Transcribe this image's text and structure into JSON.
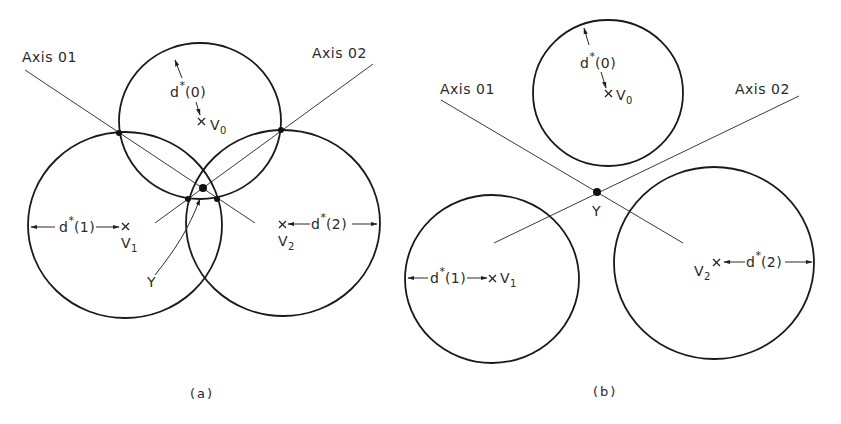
{
  "panels": [
    {
      "id": "a",
      "caption": "(a)",
      "axes": [
        {
          "label": "Axis 01"
        },
        {
          "label": "Axis 02"
        }
      ],
      "circles": [
        {
          "center_label": "V",
          "center_sub": "0",
          "radius_label": "d",
          "radius_sup": "*",
          "radius_arg": "(0)"
        },
        {
          "center_label": "V",
          "center_sub": "1",
          "radius_label": "d",
          "radius_sup": "*",
          "radius_arg": "(1)"
        },
        {
          "center_label": "V",
          "center_sub": "2",
          "radius_label": "d",
          "radius_sup": "*",
          "radius_arg": "(2)"
        }
      ],
      "point_label": "Y",
      "note": "Circles overlap; axes intersect at Y inside the common region"
    },
    {
      "id": "b",
      "caption": "(b)",
      "axes": [
        {
          "label": "Axis 01"
        },
        {
          "label": "Axis 02"
        }
      ],
      "circles": [
        {
          "center_label": "V",
          "center_sub": "0",
          "radius_label": "d",
          "radius_sup": "*",
          "radius_arg": "(0)"
        },
        {
          "center_label": "V",
          "center_sub": "1",
          "radius_label": "d",
          "radius_sup": "*",
          "radius_arg": "(1)"
        },
        {
          "center_label": "V",
          "center_sub": "2",
          "radius_label": "d",
          "radius_sup": "*",
          "radius_arg": "(2)"
        }
      ],
      "point_label": "Y",
      "note": "Circles are disjoint; axes intersect at Y outside all circles"
    }
  ],
  "colors": {
    "ink": "#1a1a1a",
    "background": "#ffffff"
  }
}
